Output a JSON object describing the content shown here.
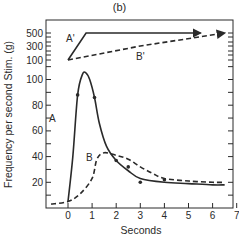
{
  "chart_data": {
    "type": "line",
    "panel_label": "(b)",
    "title": "",
    "xlabel": "Seconds",
    "ylabel": "Frequency per second Stim. (g)",
    "xlim": [
      -0.85,
      7
    ],
    "x_ticks": [
      0,
      1,
      2,
      3,
      4,
      5,
      6,
      7
    ],
    "grid": false,
    "legend": "inline labels",
    "upper_panel": {
      "description": "Stimulus force (g), log-like scale",
      "y_ticks": [
        500,
        300,
        100
      ],
      "series": [
        {
          "name": "A'",
          "style": "solid",
          "arrow_end": true,
          "points": [
            [
              0,
              100
            ],
            [
              0.75,
              500
            ],
            [
              5.5,
              500
            ]
          ]
        },
        {
          "name": "B'",
          "style": "dashed",
          "arrow_end": true,
          "points": [
            [
              0,
              100
            ],
            [
              3,
              230
            ],
            [
              5.5,
              400
            ],
            [
              6.5,
              500
            ]
          ]
        }
      ]
    },
    "lower_panel": {
      "description": "Discharge frequency per second",
      "y_ticks": [
        100,
        80,
        60,
        40,
        20
      ],
      "ylim": [
        0,
        110
      ],
      "series": [
        {
          "name": "A",
          "style": "solid",
          "x": [
            0,
            0.2,
            0.4,
            0.6,
            0.75,
            0.9,
            1.1,
            1.3,
            1.6,
            2.0,
            2.5,
            3.0,
            4.0,
            5.0,
            6.0,
            6.5
          ],
          "values": [
            5,
            40,
            88,
            104,
            105,
            100,
            86,
            66,
            48,
            37,
            29,
            23,
            20,
            19,
            18,
            18
          ],
          "markers": [
            [
              0.4,
              88
            ],
            [
              1.1,
              86
            ],
            [
              2.0,
              37
            ],
            [
              2.5,
              32
            ],
            [
              3.0,
              20
            ],
            [
              4.0,
              22
            ]
          ]
        },
        {
          "name": "B",
          "style": "dashed",
          "x": [
            -0.7,
            0,
            0.5,
            1.0,
            1.2,
            1.5,
            2.0,
            2.5,
            3.0,
            3.5,
            4.0,
            5.0,
            6.0,
            6.5
          ],
          "values": [
            3,
            5,
            11,
            23,
            38,
            43,
            41,
            38,
            32,
            27,
            23,
            21,
            20,
            20
          ]
        }
      ]
    }
  },
  "labels": {
    "panel": "(b)",
    "xlabel": "Seconds",
    "ylabel": "Frequency per second Stim. (g)",
    "series_A": "A",
    "series_B": "B",
    "series_A_prime": "A'",
    "series_B_prime": "B'"
  }
}
